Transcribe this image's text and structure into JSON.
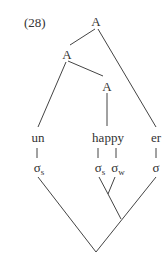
{
  "example_number": "(28)",
  "nodes": {
    "root": "A",
    "left": "A",
    "inner": "A"
  },
  "morphemes": [
    "un",
    "happy",
    "er"
  ],
  "syllables": [
    {
      "symbol": "σ",
      "sub": "s"
    },
    {
      "symbol": "σ",
      "sub": "s"
    },
    {
      "symbol": "σ",
      "sub": "w"
    },
    {
      "symbol": "σ",
      "sub": ""
    }
  ]
}
